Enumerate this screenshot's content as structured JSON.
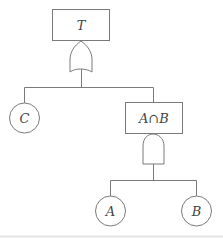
{
  "diagram": {
    "type": "fault-tree",
    "top_event": {
      "label": "T",
      "gate": "OR"
    },
    "intermediate_event": {
      "label": "A∩B",
      "gate": "AND"
    },
    "basic_events": [
      {
        "label": "C"
      },
      {
        "label": "A"
      },
      {
        "label": "B"
      }
    ],
    "colors": {
      "stroke": "#777777",
      "text": "#444444",
      "background": "#ffffff"
    }
  }
}
